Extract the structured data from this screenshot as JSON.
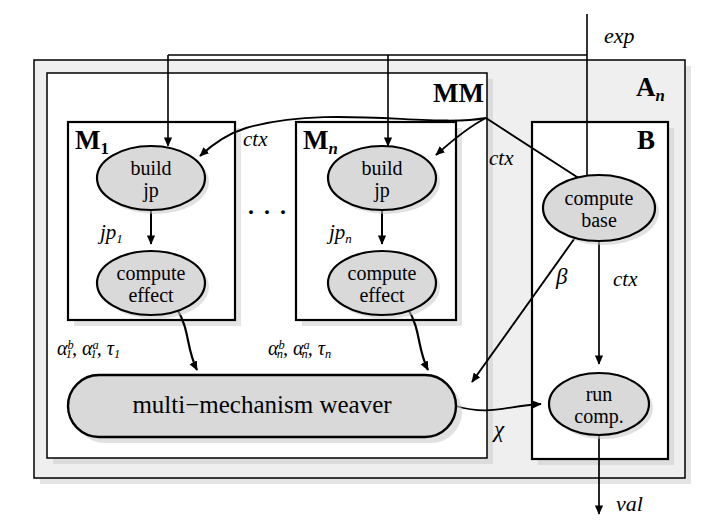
{
  "figure": {
    "kind": "block-flow-diagram",
    "background": "#ffffff",
    "stroke": "#000000",
    "node_fill": "#d9d9d9",
    "panel_fill": "#eeeeee",
    "inner_fill": "#ffffff"
  },
  "containers": {
    "outer": {
      "label": "A",
      "sublabel": "n",
      "x": 34,
      "y": 60,
      "w": 651,
      "h": 418
    },
    "mm": {
      "label": "MM",
      "x": 47,
      "y": 73,
      "w": 440,
      "h": 385
    },
    "m1": {
      "label": "M",
      "sublabel": "1",
      "x": 68,
      "y": 122,
      "w": 167,
      "h": 198
    },
    "mn": {
      "label": "M",
      "sublabel": "n",
      "x": 296,
      "y": 122,
      "w": 160,
      "h": 198
    },
    "b": {
      "label": "B",
      "x": 532,
      "y": 122,
      "w": 136,
      "h": 337
    }
  },
  "nodes": [
    {
      "id": "build-jp-1",
      "line1": "build",
      "line2": "jp",
      "cx": 151,
      "cy": 178,
      "rx": 54,
      "ry": 32
    },
    {
      "id": "compute-effect-1",
      "line1": "compute",
      "line2": "effect",
      "cx": 151,
      "cy": 283,
      "rx": 54,
      "ry": 32
    },
    {
      "id": "build-jp-n",
      "line1": "build",
      "line2": "jp",
      "cx": 382,
      "cy": 178,
      "rx": 54,
      "ry": 32
    },
    {
      "id": "compute-effect-n",
      "line1": "compute",
      "line2": "effect",
      "cx": 382,
      "cy": 283,
      "rx": 54,
      "ry": 32
    },
    {
      "id": "compute-base",
      "line1": "compute",
      "line2": "base",
      "cx": 599,
      "cy": 208,
      "rx": 56,
      "ry": 33
    },
    {
      "id": "run-comp",
      "line1": "run",
      "line2": "comp.",
      "cx": 599,
      "cy": 404,
      "rx": 50,
      "ry": 31
    }
  ],
  "weaver": {
    "id": "multi-mechanism-weaver",
    "label": "multi−mechanism weaver",
    "x": 68,
    "y": 375,
    "w": 388,
    "h": 62,
    "r": 31
  },
  "ellipsis": {
    "text": "· · ·",
    "x": 252,
    "y": 212
  },
  "edge_labels": {
    "exp": "exp",
    "ctx_left": "ctx",
    "ctx_right": "ctx",
    "ctx_b": "ctx",
    "jp1": "jp",
    "jp1_sub": "1",
    "jpn": "jp",
    "jpn_sub": "n",
    "alpha1_b": "α",
    "alpha1_b_sup": "b",
    "alpha1_b_sub": "1",
    "alpha1_a": "α",
    "alpha1_a_sup": "a",
    "alpha1_a_sub": "1",
    "tau1": "τ",
    "tau1_sub": "1",
    "alphan_b": "α",
    "alphan_b_sup": "b",
    "alphan_b_sub": "n",
    "alphan_a": "α",
    "alphan_a_sup": "a",
    "alphan_a_sub": "n",
    "taun": "τ",
    "taun_sub": "n",
    "beta": "β",
    "chi": "χ",
    "val": "val"
  },
  "edges": [
    {
      "id": "exp-in",
      "from": "external-top",
      "to": "distribution-bus",
      "label": "exp"
    },
    {
      "id": "exp-to-build-jp-1",
      "from": "distribution-bus",
      "to": "build-jp-1",
      "label": ""
    },
    {
      "id": "exp-to-build-jp-n",
      "from": "distribution-bus",
      "to": "build-jp-n",
      "label": ""
    },
    {
      "id": "exp-to-compute-base",
      "from": "distribution-bus",
      "to": "compute-base",
      "label": ""
    },
    {
      "id": "ctx-to-build-jp-1",
      "from": "mm-junction",
      "to": "build-jp-1",
      "label": "ctx"
    },
    {
      "id": "ctx-to-build-jp-n",
      "from": "mm-junction",
      "to": "build-jp-n",
      "label": "ctx"
    },
    {
      "id": "ctx-to-compute-base",
      "from": "mm-junction",
      "to": "compute-base",
      "label": "ctx"
    },
    {
      "id": "jp1-edge",
      "from": "build-jp-1",
      "to": "compute-effect-1",
      "label": "jp_1"
    },
    {
      "id": "jpn-edge",
      "from": "build-jp-n",
      "to": "compute-effect-n",
      "label": "jp_n"
    },
    {
      "id": "alpha1-edge",
      "from": "compute-effect-1",
      "to": "weaver",
      "label": "alpha_1^b, alpha_1^a, tau_1"
    },
    {
      "id": "alphan-edge",
      "from": "compute-effect-n",
      "to": "weaver",
      "label": "alpha_n^b, alpha_n^a, tau_n"
    },
    {
      "id": "beta-edge",
      "from": "compute-base",
      "to": "weaver",
      "label": "beta"
    },
    {
      "id": "ctxb-edge",
      "from": "compute-base",
      "to": "run-comp",
      "label": "ctx"
    },
    {
      "id": "chi-edge",
      "from": "weaver",
      "to": "run-comp",
      "label": "chi"
    },
    {
      "id": "val-out",
      "from": "run-comp",
      "to": "external-bottom",
      "label": "val"
    }
  ]
}
